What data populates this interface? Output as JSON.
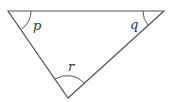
{
  "diagram": {
    "type": "triangle",
    "vertices": {
      "top_left": [
        8,
        11
      ],
      "top_right": [
        164,
        11
      ],
      "bottom": [
        68,
        98
      ]
    },
    "angles": [
      {
        "label": "p",
        "vertex": "top_left"
      },
      {
        "label": "q",
        "vertex": "top_right"
      },
      {
        "label": "r",
        "vertex": "bottom"
      }
    ],
    "colors": {
      "stroke": "#555555",
      "text": "#333333",
      "background": "#ffffff"
    }
  }
}
